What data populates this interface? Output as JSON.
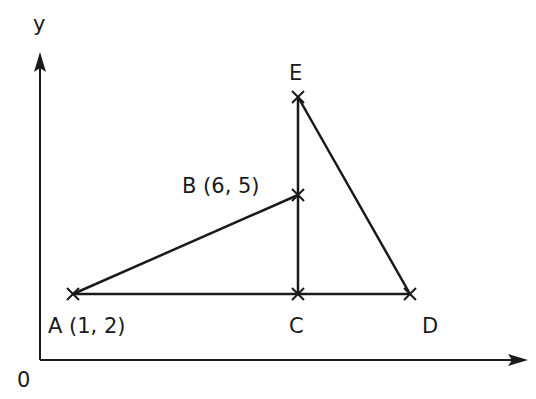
{
  "diagram": {
    "axes": {
      "y_label": "y",
      "origin_label": "0"
    },
    "points": {
      "A": {
        "name": "A",
        "label": "A (1, 2)",
        "coords": [
          1,
          2
        ]
      },
      "B": {
        "name": "B",
        "label": "B (6, 5)",
        "coords": [
          6,
          5
        ]
      },
      "C": {
        "name": "C",
        "label": "C"
      },
      "D": {
        "name": "D",
        "label": "D"
      },
      "E": {
        "name": "E",
        "label": "E"
      }
    },
    "segments": [
      "AB",
      "AC",
      "CD",
      "CE",
      "ED"
    ],
    "colors": {
      "stroke": "#1a1a1a",
      "background": "#ffffff"
    }
  }
}
